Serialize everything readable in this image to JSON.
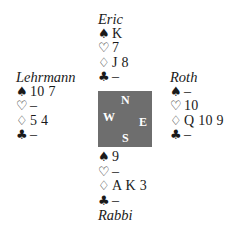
{
  "diagram": {
    "type": "bridge-deal",
    "table_background": "#6e6e6e",
    "compass": {
      "north": "N",
      "west": "W",
      "east": "E",
      "south": "S"
    },
    "suit_symbols": {
      "spades": "♠",
      "hearts": "♡",
      "diamonds": "♢",
      "clubs": "♣"
    },
    "hands": {
      "north": {
        "player": "Eric",
        "spades": "K",
        "hearts": "7",
        "diamonds": "J 8",
        "clubs": "–"
      },
      "west": {
        "player": "Lehrmann",
        "spades": "10 7",
        "hearts": "–",
        "diamonds": "5 4",
        "clubs": "–"
      },
      "east": {
        "player": "Roth",
        "spades": "–",
        "hearts": "10",
        "diamonds": "Q 10 9",
        "clubs": "–"
      },
      "south": {
        "player": "Rabbi",
        "spades": "9",
        "hearts": "–",
        "diamonds": "A K 3",
        "clubs": "–"
      }
    }
  }
}
